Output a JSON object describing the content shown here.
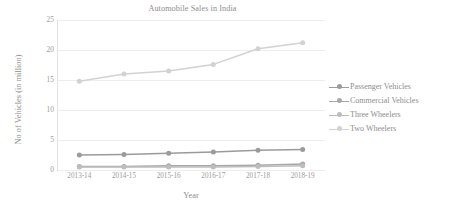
{
  "chart_data": {
    "type": "line",
    "title": "Automobile Sales in India",
    "xlabel": "Year",
    "ylabel": "No of Vehicles (in million)",
    "categories": [
      "2013-14",
      "2014-15",
      "2015-16",
      "2016-17",
      "2017-18",
      "2018-19"
    ],
    "yticks": [
      0,
      5,
      10,
      15,
      20,
      25
    ],
    "ylim": [
      0,
      25
    ],
    "grid": "horizontal",
    "legend_position": "right",
    "markers": "circle",
    "series": [
      {
        "name": "Passenger Vehicles",
        "color": "#9b9b9b",
        "values": [
          2.5,
          2.6,
          2.8,
          3.0,
          3.3,
          3.4
        ]
      },
      {
        "name": "Commercial Vehicles",
        "color": "#a8a8a8",
        "values": [
          0.6,
          0.6,
          0.7,
          0.7,
          0.8,
          1.0
        ]
      },
      {
        "name": "Three Wheelers",
        "color": "#bdbdbd",
        "values": [
          0.5,
          0.5,
          0.5,
          0.5,
          0.6,
          0.7
        ]
      },
      {
        "name": "Two Wheelers",
        "color": "#d2d2d2",
        "values": [
          14.8,
          16.0,
          16.5,
          17.6,
          20.2,
          21.2
        ]
      }
    ]
  },
  "colors": {
    "gridline": "#ededed",
    "axis": "#e2e2e2",
    "text": "#8d8d8d",
    "background": "#ffffff"
  }
}
